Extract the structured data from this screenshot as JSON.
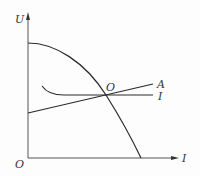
{
  "diagram": {
    "type": "characteristic-curve-plot",
    "axes": {
      "y_label": "U",
      "x_label": "I",
      "origin_label": "O"
    },
    "curves": [
      {
        "id": "parabola",
        "label": "",
        "description": "downward curve from U-axis intercept to I-axis"
      },
      {
        "id": "line-a",
        "label": "A",
        "description": "rising straight line from U-axis"
      },
      {
        "id": "curve-i",
        "label": "I",
        "description": "curve flattening into horizontal line"
      }
    ],
    "intersection_label": "O",
    "colors": {
      "stroke": "#2a2a2a",
      "axis": "#555555",
      "background": "#fdfdfd"
    }
  }
}
